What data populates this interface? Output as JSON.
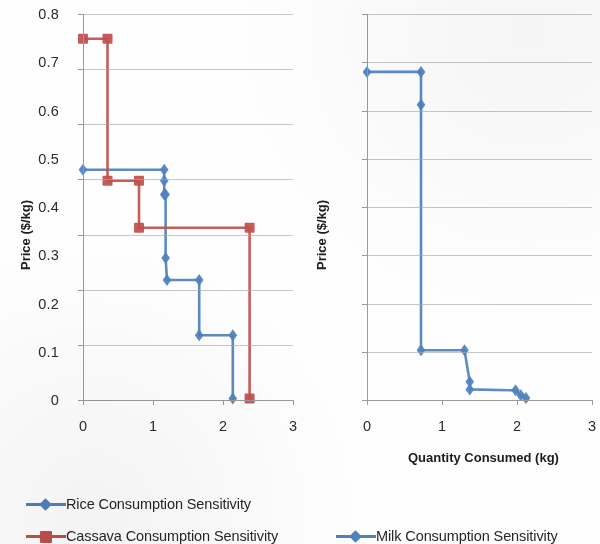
{
  "colors": {
    "rice_blue": "#4F81BD",
    "cassava_red": "#C0504D",
    "milk_blue": "#4F81BD",
    "gridline": "#a9a9a9",
    "axis": "#9a9a9a",
    "text": "#231f20",
    "background": "#fefefe"
  },
  "legend": {
    "items": [
      {
        "label": "Rice Consumption Sensitivity",
        "marker": "diamond",
        "color": "#4F81BD"
      },
      {
        "label": "Cassava Consumption Sensitivity",
        "marker": "square",
        "color": "#C0504D"
      },
      {
        "label": "Milk Consumption Sensitivity",
        "marker": "diamond",
        "color": "#4F81BD"
      }
    ]
  },
  "chart_data": [
    {
      "id": "left-chart",
      "type": "line",
      "title": "",
      "xlabel": "",
      "ylabel": "Price ($/kg)",
      "xlim": [
        0,
        3
      ],
      "ylim": [
        0,
        0.14
      ],
      "xticks": [
        0,
        1,
        2,
        3
      ],
      "xticklabels": [
        "0",
        "1",
        "2",
        "3"
      ],
      "yticks": [
        0,
        0.02,
        0.04,
        0.06,
        0.08,
        0.1,
        0.12,
        0.14
      ],
      "yticklabels": [
        "0",
        "0.02",
        "0.04",
        "0.06",
        "0.08",
        "0.1",
        "0.12",
        "0.14"
      ],
      "grid": "horizontal",
      "legend_position": "below",
      "series": [
        {
          "name": "Rice Consumption Sensitivity",
          "color": "#4F81BD",
          "marker": "diamond",
          "x": [
            0.0,
            1.16,
            1.16,
            1.16,
            1.18,
            1.18,
            1.2,
            1.66,
            1.66,
            2.14,
            2.14
          ],
          "y": [
            0.0835,
            0.0835,
            0.0795,
            0.0745,
            0.0745,
            0.0515,
            0.0435,
            0.0435,
            0.0235,
            0.0235,
            0.0005
          ]
        },
        {
          "name": "Cassava Consumption Sensitivity",
          "color": "#C0504D",
          "marker": "square",
          "x": [
            0.0,
            0.35,
            0.35,
            0.8,
            0.8,
            2.38,
            2.38
          ],
          "y": [
            0.131,
            0.131,
            0.0795,
            0.0795,
            0.0625,
            0.0625,
            0.0005
          ]
        }
      ]
    },
    {
      "id": "right-chart",
      "type": "line",
      "title": "",
      "xlabel": "Quantity Consumed (kg)",
      "ylabel": "Price ($/kg)",
      "xlim": [
        0,
        3
      ],
      "ylim": [
        0,
        0.8
      ],
      "xticks": [
        0,
        1,
        2,
        3
      ],
      "xticklabels": [
        "0",
        "1",
        "2",
        "3"
      ],
      "yticks": [
        0,
        0.1,
        0.2,
        0.3,
        0.4,
        0.5,
        0.6,
        0.7,
        0.8
      ],
      "yticklabels": [
        "0",
        "0.1",
        "0.2",
        "0.3",
        "0.4",
        "0.5",
        "0.6",
        "0.7",
        "0.8"
      ],
      "grid": "horizontal",
      "legend_position": "below",
      "series": [
        {
          "name": "Milk Consumption Sensitivity",
          "color": "#4F81BD",
          "marker": "diamond",
          "x": [
            0.0,
            0.72,
            0.72,
            0.72,
            1.3,
            1.37,
            1.37,
            1.98,
            2.05,
            2.12
          ],
          "y": [
            0.68,
            0.68,
            0.612,
            0.103,
            0.103,
            0.038,
            0.022,
            0.02,
            0.01,
            0.004
          ]
        }
      ]
    }
  ]
}
